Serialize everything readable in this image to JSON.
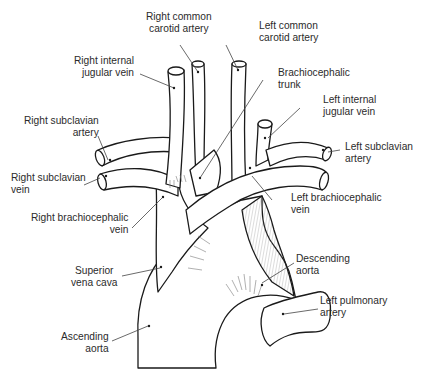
{
  "diagram": {
    "labels": {
      "right_common_carotid": {
        "line1": "Right common",
        "line2": "carotid artery"
      },
      "left_common_carotid": {
        "line1": "Left common",
        "line2": "carotid artery"
      },
      "right_internal_jugular": {
        "line1": "Right internal",
        "line2": "jugular vein"
      },
      "brachiocephalic_trunk": {
        "line1": "Brachiocephalic",
        "line2": "trunk"
      },
      "left_internal_jugular": {
        "line1": "Left internal",
        "line2": "jugular vein"
      },
      "right_subclavian_artery": {
        "line1": "Right subclavian",
        "line2": "artery"
      },
      "left_subclavian_artery": {
        "line1": "Left subclavian",
        "line2": "artery"
      },
      "right_subclavian_vein": {
        "line1": "Right subclavian",
        "line2": "vein"
      },
      "left_brachiocephalic_vein": {
        "line1": "Left brachiocephalic",
        "line2": "vein"
      },
      "right_brachiocephalic_vein": {
        "line1": "Right brachiocephalic",
        "line2": "vein"
      },
      "superior_vena_cava": {
        "line1": "Superior",
        "line2": "vena cava"
      },
      "descending_aorta": {
        "line1": "Descending",
        "line2": "aorta"
      },
      "left_pulmonary_artery": {
        "line1": "Left pulmonary",
        "line2": "artery"
      },
      "ascending_aorta": {
        "line1": "Ascending",
        "line2": "aorta"
      }
    },
    "colors": {
      "stroke": "#1a1a1a",
      "hatch": "#6a6a6a",
      "leader": "#444444",
      "text": "#2b2b2b",
      "background": "#ffffff"
    }
  }
}
